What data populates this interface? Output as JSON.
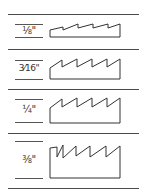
{
  "sizes": [
    {
      "label": "1/8\"",
      "display": "⅛\""
    },
    {
      "label": "3/16\"",
      "display": "3⁄16\""
    },
    {
      "label": "1/4\"",
      "display": "¼\""
    },
    {
      "label": "3/8\"",
      "display": "⅜\""
    }
  ],
  "colors": {
    "line": "#4a4a4a",
    "ink": "#333333",
    "background": "#ffffff"
  }
}
